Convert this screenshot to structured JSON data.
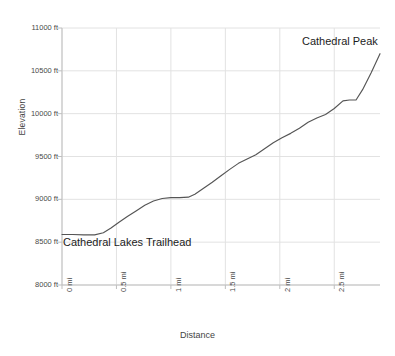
{
  "chart_data": {
    "type": "line",
    "title": "",
    "xlabel": "Distance",
    "ylabel": "Elevation",
    "xlim": [
      0,
      2.92
    ],
    "ylim": [
      8000,
      11000
    ],
    "grid": true,
    "legend": null,
    "x_tick_labels": [
      "0 mi",
      "0.5 mi",
      "1 mi",
      "1.5 mi",
      "2 mi",
      "2.5 mi"
    ],
    "x_tick_values": [
      0,
      0.5,
      1,
      1.5,
      2,
      2.5
    ],
    "y_tick_labels": [
      "8000 ft",
      "8500 ft",
      "9000 ft",
      "9500 ft",
      "10000 ft",
      "10500 ft",
      "11000 ft"
    ],
    "y_tick_values": [
      8000,
      8500,
      9000,
      9500,
      10000,
      10500,
      11000
    ],
    "x_unit": "mi",
    "y_unit": "ft",
    "line_color": "#555555",
    "grid_color": "#e2e2e2",
    "axis_color": "#bfbfbf",
    "series": [
      {
        "name": "Elevation profile",
        "x": [
          0.0,
          0.1,
          0.2,
          0.3,
          0.38,
          0.45,
          0.52,
          0.6,
          0.68,
          0.76,
          0.84,
          0.92,
          1.0,
          1.08,
          1.16,
          1.22,
          1.3,
          1.38,
          1.46,
          1.54,
          1.62,
          1.7,
          1.78,
          1.86,
          1.94,
          2.02,
          2.1,
          2.18,
          2.26,
          2.34,
          2.42,
          2.5,
          2.58,
          2.64,
          2.7,
          2.76,
          2.84,
          2.92
        ],
        "y": [
          8590,
          8590,
          8585,
          8585,
          8610,
          8665,
          8730,
          8800,
          8865,
          8930,
          8980,
          9010,
          9020,
          9020,
          9025,
          9060,
          9130,
          9200,
          9275,
          9350,
          9420,
          9470,
          9520,
          9590,
          9660,
          9720,
          9770,
          9830,
          9900,
          9950,
          9990,
          10060,
          10150,
          10160,
          10160,
          10280,
          10480,
          10700
        ]
      }
    ],
    "annotations": [
      {
        "name": "trailhead",
        "label": "Cathedral Lakes Trailhead",
        "x": 0.0,
        "y": 8500
      },
      {
        "name": "peak",
        "label": "Cathedral Peak",
        "x": 2.5,
        "y": 10800
      }
    ]
  }
}
